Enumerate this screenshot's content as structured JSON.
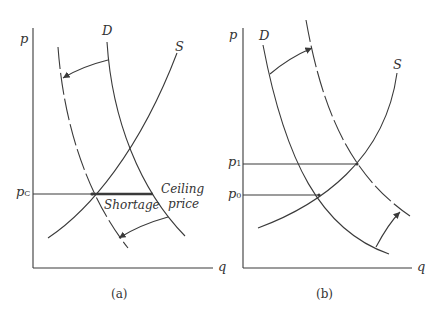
{
  "figure": {
    "panel_a": {
      "caption": "(a)",
      "y_axis_label": "p",
      "x_axis_label": "q",
      "curves": {
        "demand": "D",
        "supply": "S"
      },
      "price_label": "p",
      "price_sub": "C",
      "shortage_label": "Shortage",
      "ceiling_label_1": "Ceiling",
      "ceiling_label_2": "price"
    },
    "panel_b": {
      "caption": "(b)",
      "y_axis_label": "p",
      "x_axis_label": "q",
      "curves": {
        "demand": "D",
        "supply": "S"
      },
      "p1_label": "p",
      "p1_sub": "1",
      "p0_label": "p",
      "p0_sub": "0"
    }
  },
  "colors": {
    "line": "#3a3a3a",
    "background": "#ffffff"
  }
}
